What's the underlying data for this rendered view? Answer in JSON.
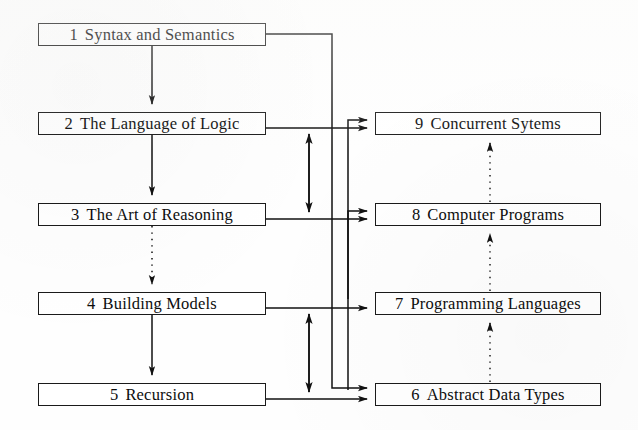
{
  "diagram": {
    "type": "flowchart",
    "background_color": "#ffffff",
    "line_color": "#1a1a1a",
    "box_border_color": "#1a1a1a",
    "nodes": [
      {
        "id": "ch1",
        "number": "1",
        "title": "Syntax and Semantics",
        "column": "left",
        "x": 38,
        "y": 23,
        "w": 228,
        "h": 23
      },
      {
        "id": "ch2",
        "number": "2",
        "title": "The Language of Logic",
        "column": "left",
        "x": 38,
        "y": 112,
        "w": 228,
        "h": 23
      },
      {
        "id": "ch3",
        "number": "3",
        "title": "The Art of Reasoning",
        "column": "left",
        "x": 38,
        "y": 203,
        "w": 228,
        "h": 23
      },
      {
        "id": "ch4",
        "number": "4",
        "title": "Building Models",
        "column": "left",
        "x": 38,
        "y": 292,
        "w": 228,
        "h": 23
      },
      {
        "id": "ch5",
        "number": "5",
        "title": "Recursion",
        "column": "left",
        "x": 38,
        "y": 383,
        "w": 228,
        "h": 23
      },
      {
        "id": "ch9",
        "number": "9",
        "title": "Concurrent Sytems",
        "column": "right",
        "x": 375,
        "y": 112,
        "w": 226,
        "h": 23
      },
      {
        "id": "ch8",
        "number": "8",
        "title": "Computer Programs",
        "column": "right",
        "x": 375,
        "y": 203,
        "w": 226,
        "h": 23
      },
      {
        "id": "ch7",
        "number": "7",
        "title": "Programming Languages",
        "column": "right",
        "x": 375,
        "y": 292,
        "w": 226,
        "h": 23
      },
      {
        "id": "ch6",
        "number": "6",
        "title": "Abstract Data Types",
        "column": "right",
        "x": 375,
        "y": 383,
        "w": 226,
        "h": 23
      }
    ],
    "edges": [
      {
        "from": "ch1",
        "to": "ch2",
        "style": "solid",
        "kind": "down-arrow"
      },
      {
        "from": "ch2",
        "to": "ch3",
        "style": "solid",
        "kind": "down-arrow"
      },
      {
        "from": "ch3",
        "to": "ch4",
        "style": "dotted",
        "kind": "down-arrow"
      },
      {
        "from": "ch4",
        "to": "ch5",
        "style": "solid",
        "kind": "down-arrow"
      },
      {
        "from": "ch1",
        "to": "ch6",
        "style": "solid",
        "kind": "right-arrow-routed"
      },
      {
        "from": "ch2",
        "to": "ch9",
        "style": "solid",
        "kind": "right-arrow"
      },
      {
        "from": "ch3",
        "to": "ch8",
        "style": "solid",
        "kind": "right-arrow"
      },
      {
        "from": "ch4",
        "to": "ch7",
        "style": "solid",
        "kind": "right-arrow"
      },
      {
        "from": "ch5",
        "to": "ch6",
        "style": "solid",
        "kind": "right-arrow"
      },
      {
        "from": "ch3",
        "to": "ch2",
        "style": "solid",
        "kind": "double-arrow-vertical"
      },
      {
        "from": "ch5",
        "to": "ch4",
        "style": "solid",
        "kind": "double-arrow-vertical"
      },
      {
        "from": "ch7",
        "to": "ch9",
        "style": "solid",
        "kind": "right-arrow-routed"
      },
      {
        "from": "ch6",
        "to": "ch8",
        "style": "solid",
        "kind": "right-arrow-routed"
      },
      {
        "from": "ch8",
        "to": "ch9",
        "style": "dotted",
        "kind": "up-arrow"
      },
      {
        "from": "ch7",
        "to": "ch8",
        "style": "dotted",
        "kind": "up-arrow"
      },
      {
        "from": "ch6",
        "to": "ch7",
        "style": "dotted",
        "kind": "up-arrow"
      }
    ]
  }
}
